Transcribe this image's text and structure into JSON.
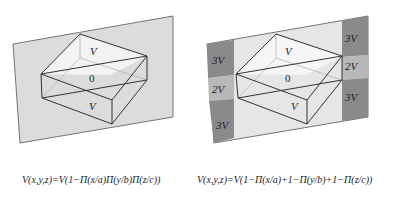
{
  "left_diagram": {
    "labels": {
      "top": "V",
      "middle": "0",
      "bottom": "V"
    },
    "equation": "V(x,y,z)=V(1−Π(x/a)Π(y/b)Π(z/c))"
  },
  "right_diagram": {
    "labels": {
      "top": "V",
      "middle": "0",
      "bottom": "V"
    },
    "side_labels": {
      "left_top": "3V",
      "left_mid": "2V",
      "left_bottom": "3V",
      "right_top": "3V",
      "right_mid": "2V",
      "right_bottom": "3V"
    },
    "equation": "V(x,y,z)=V(1−Π(x/a)+1−Π(y/b)+1−Π(z/c))"
  },
  "colors": {
    "plane": "#dcdcdc",
    "plane_light": "#e6e6e6",
    "dark_region": "#8a8a8a",
    "mid_region": "#b8b8b8",
    "line": "#333333"
  }
}
